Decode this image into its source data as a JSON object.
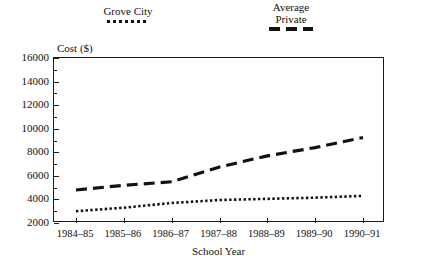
{
  "chart_data": {
    "type": "line",
    "title": "",
    "xlabel": "School Year",
    "ylabel": "Cost ($)",
    "categories": [
      "1984–85",
      "1985–86",
      "1986–87",
      "1987–88",
      "1988–89",
      "1989–90",
      "1990–91"
    ],
    "ylim": [
      2000,
      16000
    ],
    "ytick_values": [
      2000,
      4000,
      6000,
      8000,
      10000,
      12000,
      14000,
      16000
    ],
    "ytick_labels": [
      "2000",
      "4000",
      "6000",
      "8000",
      "10000",
      "12000",
      "14000",
      "16000"
    ],
    "yminor_values": [
      3000,
      5000,
      7000,
      9000,
      11000,
      13000,
      15000
    ],
    "grid": false,
    "legend_position": "above-plot",
    "series": [
      {
        "name": "Grove City",
        "style": "dotted",
        "values": [
          3000,
          3300,
          3700,
          3950,
          4050,
          4150,
          4300
        ]
      },
      {
        "name": "Average\nPrivate",
        "style": "dashed",
        "values": [
          4800,
          5200,
          5500,
          6750,
          7700,
          8400,
          9250
        ]
      }
    ]
  },
  "legend": {
    "grove_city": {
      "label": "Grove City",
      "swatch": "dotted-line-swatch"
    },
    "average_private": {
      "label": "Average\nPrivate",
      "swatch": "dashed-line-swatch"
    }
  },
  "axes": {
    "y_title": "Cost ($)",
    "x_title": "School Year"
  },
  "colors": {
    "line": "#111111",
    "frame": "#1a1a1a",
    "background": "#ffffff"
  }
}
